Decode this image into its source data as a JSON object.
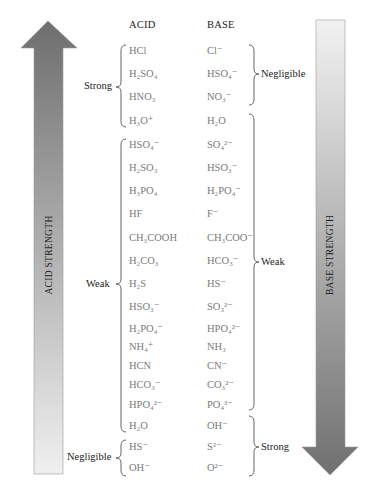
{
  "headers": {
    "acid": "ACID",
    "base": "BASE"
  },
  "arrows": {
    "acid": {
      "label": "ACID STRENGTH",
      "direction": "up",
      "dark": "#6f6f6f",
      "light": "#ececec"
    },
    "base": {
      "label": "BASE STRENGTH",
      "direction": "down",
      "dark": "#6f6f6f",
      "light": "#ececec"
    }
  },
  "acid_groups": [
    {
      "label": "Strong",
      "rows": "HCl to H3O+"
    },
    {
      "label": "Weak",
      "rows": "HSO4- to H2O"
    },
    {
      "label": "Negligible",
      "rows": "HS- to OH-"
    }
  ],
  "base_groups": [
    {
      "label": "Negligible",
      "rows": "Cl- to NO3-"
    },
    {
      "label": "Weak",
      "rows": "H2O to PO4 3-"
    },
    {
      "label": "Strong",
      "rows": "OH- to O2-"
    }
  ],
  "pairs": [
    {
      "acid": "HCl",
      "base": "Cl⁻"
    },
    {
      "acid": "H₂SO₄",
      "base": "HSO₄⁻"
    },
    {
      "acid": "HNO₃",
      "base": "NO₃⁻"
    },
    {
      "acid": "H₃O⁺",
      "base": "H₂O"
    },
    {
      "acid": "HSO₄⁻",
      "base": "SO₄²⁻"
    },
    {
      "acid": "H₂SO₃",
      "base": "HSO₃⁻"
    },
    {
      "acid": "H₃PO₄",
      "base": "H₂PO₄⁻"
    },
    {
      "acid": "HF",
      "base": "F⁻"
    },
    {
      "acid": "CH₃COOH",
      "base": "CH₃COO⁻"
    },
    {
      "acid": "H₂CO₃",
      "base": "HCO₃⁻"
    },
    {
      "acid": "H₂S",
      "base": "HS⁻"
    },
    {
      "acid": "HSO₃⁻",
      "base": "SO₃²⁻"
    },
    {
      "acid": "H₂PO₄⁻",
      "base": "HPO₄²⁻"
    },
    {
      "acid": "NH₄⁺",
      "base": "NH₃"
    },
    {
      "acid": "HCN",
      "base": "CN⁻"
    },
    {
      "acid": "HCO₃⁻",
      "base": "CO₃²⁻"
    },
    {
      "acid": "HPO₄²⁻",
      "base": "PO₄³⁻"
    },
    {
      "acid": "H₂O",
      "base": "OH⁻"
    },
    {
      "acid": "HS⁻",
      "base": "S²⁻"
    },
    {
      "acid": "OH⁻",
      "base": "O²⁻"
    }
  ]
}
